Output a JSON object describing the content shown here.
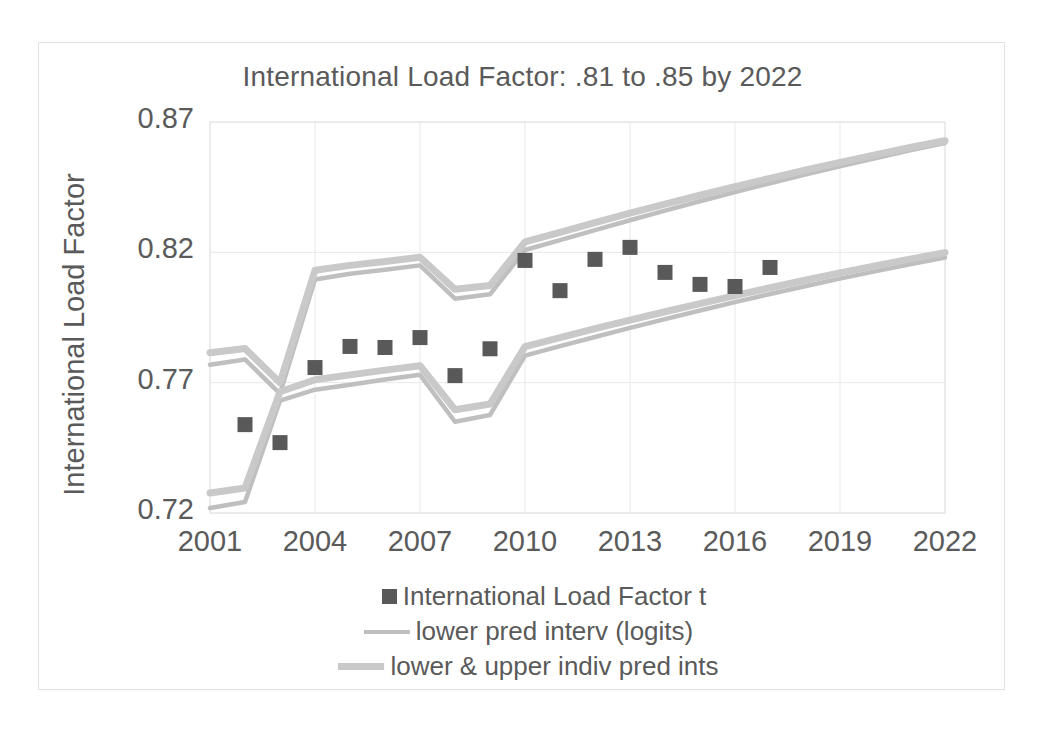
{
  "chart_data": {
    "type": "scatter",
    "title": "International Load Factor:  .81 to .85 by 2022",
    "xlabel": "",
    "ylabel": "International Load Factor",
    "xlim": [
      2001,
      2022
    ],
    "ylim": [
      0.72,
      0.87
    ],
    "xticks": [
      "2001",
      "2004",
      "2007",
      "2010",
      "2013",
      "2016",
      "2019",
      "2022"
    ],
    "yticks": [
      "0.87",
      "0.82",
      "0.77",
      "0.72"
    ],
    "grid": true,
    "legend_position": "bottom",
    "colors": {
      "marker": "#595959",
      "pred_interval_line": "#bfbfbf",
      "indiv_pred_line": "#c9c9c9",
      "gridline": "#e8e8e8",
      "text": "#5a5a5a"
    },
    "series": [
      {
        "name": "International Load Factor t",
        "type": "scatter",
        "marker": "square",
        "x": [
          2002,
          2003,
          2004,
          2005,
          2006,
          2007,
          2008,
          2009,
          2010,
          2011,
          2012,
          2013,
          2014,
          2015,
          2016,
          2017
        ],
        "values": [
          0.7539,
          0.747,
          0.7758,
          0.7839,
          0.7835,
          0.7873,
          0.7727,
          0.783,
          0.8169,
          0.8053,
          0.8173,
          0.8219,
          0.8123,
          0.8077,
          0.8069,
          0.8142
        ]
      },
      {
        "name": "lower pred interv (logits)",
        "type": "line",
        "x": [
          2001,
          2002,
          2003,
          2004,
          2005,
          2006,
          2007,
          2008,
          2009,
          2010,
          2011,
          2012,
          2013,
          2014,
          2015,
          2016,
          2017,
          2018,
          2019,
          2020,
          2021,
          2022
        ],
        "values": [
          0.7769,
          0.7789,
          0.7658,
          0.8096,
          0.8118,
          0.8133,
          0.815,
          0.8022,
          0.8039,
          0.8209,
          0.8247,
          0.8285,
          0.8323,
          0.836,
          0.8396,
          0.8431,
          0.8465,
          0.8498,
          0.853,
          0.8561,
          0.8591,
          0.8619
        ]
      },
      {
        "name": "lower pred interv (logits) lower bound",
        "type": "line",
        "x": [
          2001,
          2002,
          2003,
          2004,
          2005,
          2006,
          2007,
          2008,
          2009,
          2010,
          2011,
          2012,
          2013,
          2014,
          2015,
          2016,
          2017,
          2018,
          2019,
          2020,
          2021,
          2022
        ],
        "values": [
          0.7219,
          0.7242,
          0.7631,
          0.7673,
          0.7692,
          0.7712,
          0.773,
          0.755,
          0.7576,
          0.7804,
          0.784,
          0.7875,
          0.791,
          0.7944,
          0.7977,
          0.8009,
          0.804,
          0.807,
          0.8099,
          0.8127,
          0.8154,
          0.818
        ]
      },
      {
        "name": "lower & upper indiv pred ints",
        "type": "line",
        "x": [
          2001,
          2002,
          2003,
          2004,
          2005,
          2006,
          2007,
          2008,
          2009,
          2010,
          2011,
          2012,
          2013,
          2014,
          2015,
          2016,
          2017,
          2018,
          2019,
          2020,
          2021,
          2022
        ],
        "values": [
          0.7815,
          0.7831,
          0.77,
          0.8131,
          0.815,
          0.8165,
          0.8181,
          0.8058,
          0.8073,
          0.824,
          0.8277,
          0.8314,
          0.835,
          0.8385,
          0.8419,
          0.8452,
          0.8484,
          0.8515,
          0.8545,
          0.8574,
          0.8602,
          0.8628
        ]
      },
      {
        "name": "lower & upper indiv pred ints lower bound",
        "type": "line",
        "x": [
          2001,
          2002,
          2003,
          2004,
          2005,
          2006,
          2007,
          2008,
          2009,
          2010,
          2011,
          2012,
          2013,
          2014,
          2015,
          2016,
          2017,
          2018,
          2019,
          2020,
          2021,
          2022
        ],
        "values": [
          0.7277,
          0.7296,
          0.7665,
          0.7711,
          0.773,
          0.7748,
          0.7765,
          0.7596,
          0.7618,
          0.7838,
          0.7873,
          0.7907,
          0.794,
          0.7972,
          0.8003,
          0.8034,
          0.8064,
          0.8093,
          0.8121,
          0.8148,
          0.8174,
          0.8199
        ]
      }
    ],
    "legend": [
      {
        "label": "International Load Factor t",
        "key": "marker"
      },
      {
        "label": "lower pred interv (logits)",
        "key": "thin-line"
      },
      {
        "label": "lower & upper indiv pred ints",
        "key": "thick-line"
      }
    ]
  }
}
